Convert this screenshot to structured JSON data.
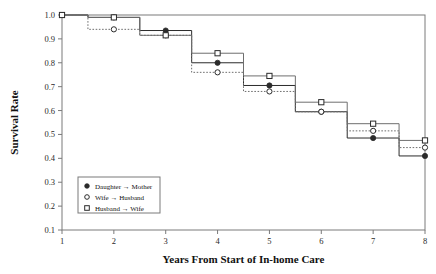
{
  "chart_data": {
    "type": "line",
    "title": "",
    "xlabel": "Years From Start of In-home Care",
    "ylabel": "Survival Rate",
    "xlim": [
      1,
      8
    ],
    "ylim": [
      0.1,
      1.0
    ],
    "xticks": [
      "1",
      "2",
      "3",
      "4",
      "5",
      "6",
      "7",
      "8"
    ],
    "yticks": [
      "1.0",
      "0.9",
      "0.8",
      "0.7",
      "0.6",
      "0.5",
      "0.4",
      "0.3",
      "0.2",
      "0.1"
    ],
    "grid": false,
    "step_style": "step-mid",
    "legend_position": "lower-left",
    "x": [
      1,
      2,
      3,
      4,
      5,
      6,
      7,
      8
    ],
    "series": [
      {
        "name": "Daughter → Mother",
        "marker": "filled-circle",
        "line": "solid",
        "values": [
          1.0,
          0.99,
          0.935,
          0.8,
          0.705,
          0.595,
          0.485,
          0.41
        ]
      },
      {
        "name": "Wife → Husband",
        "marker": "open-circle",
        "line": "dotted",
        "values": [
          1.0,
          0.94,
          0.915,
          0.76,
          0.68,
          0.595,
          0.515,
          0.445
        ]
      },
      {
        "name": "Husband → Wife",
        "marker": "open-square",
        "line": "solid",
        "values": [
          1.0,
          0.99,
          0.915,
          0.84,
          0.745,
          0.635,
          0.545,
          0.475
        ]
      }
    ]
  },
  "legend": {
    "entries": [
      {
        "label": "Daughter → Mother",
        "marker": "filled-circle"
      },
      {
        "label": "Wife → Husband",
        "marker": "open-circle"
      },
      {
        "label": "Husband → Wife",
        "marker": "open-square"
      }
    ]
  },
  "colors": {
    "ink": "#111111",
    "axis": "#7a7a7a",
    "series_dark": "#2b2b2b",
    "series_grey": "#6e6e6e",
    "background": "#ffffff"
  }
}
